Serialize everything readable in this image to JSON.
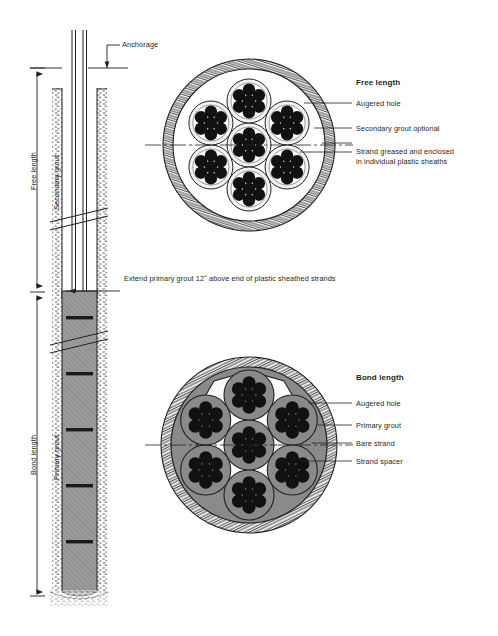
{
  "diagram": {
    "colors": {
      "ink": "#231f20",
      "grout_gray": "#8a8a8a",
      "grout_gray_light": "#a8a8a8",
      "strand_dark": "#111111",
      "spacer_white": "#ffffff",
      "sheath_light": "#efefef"
    }
  },
  "profile": {
    "anchorage_label": "Anchorage",
    "free_length_label": "Free length",
    "secondary_grout_label": "Secondary grout",
    "bond_length_label": "Bond length",
    "primary_grout_label": "Primary grout",
    "extend_note": "Extend primary grout 12ʺ above end of plastic sheathed strands"
  },
  "free_section": {
    "heading": "Free length",
    "callouts": [
      {
        "label": "Augered hole"
      },
      {
        "label": "Secondary grout optional"
      },
      {
        "label": "Strand greased and enclosed"
      },
      {
        "label": "in individual plastic sheaths"
      }
    ]
  },
  "bond_section": {
    "heading": "Bond length",
    "callouts": [
      {
        "label": "Augered hole"
      },
      {
        "label": "Primary grout"
      },
      {
        "label": "Bare strand"
      },
      {
        "label": "Strand spacer"
      }
    ]
  }
}
